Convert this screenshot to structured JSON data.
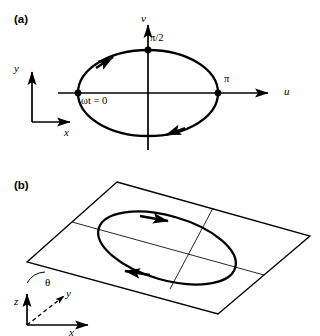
{
  "figure": {
    "type": "diagram",
    "panels": [
      {
        "id": "a",
        "label": "(a)",
        "axes": {
          "horizontal_label": "u",
          "vertical_label": "v",
          "origin_px": [
            148,
            93
          ]
        },
        "reference_axes": {
          "vertical_label": "y",
          "horizontal_label": "x",
          "corner_px": [
            32,
            122
          ]
        },
        "ellipse": {
          "center_px": [
            148,
            93
          ],
          "semi_major_px": 70,
          "semi_minor_px": 43,
          "sense": "counterclockwise"
        },
        "markers": [
          {
            "name": "phase-zero",
            "label": "ωt = 0",
            "at_px": [
              78,
              93
            ]
          },
          {
            "name": "phase-half-pi",
            "label": "π/2",
            "at_px": [
              148,
              50
            ]
          },
          {
            "name": "phase-pi",
            "label": "π",
            "at_px": [
              218,
              93
            ]
          }
        ],
        "direction_arrows": [
          {
            "name": "arrow-upper-left",
            "direction": "counterclockwise"
          },
          {
            "name": "arrow-lower-right",
            "direction": "counterclockwise"
          }
        ]
      },
      {
        "id": "b",
        "label": "(b)",
        "plane": {
          "name": "tilted-plane",
          "vertices_px": [
            [
              117,
              182
            ],
            [
              310,
              236
            ],
            [
              218,
              314
            ],
            [
              27,
              262
            ]
          ],
          "grid_lines": 2
        },
        "ellipse": {
          "center_px": [
            167,
            248
          ],
          "sense": "counterclockwise",
          "rotated": true
        },
        "angle": {
          "name": "theta",
          "label": "θ",
          "at_px": [
            47,
            283
          ]
        },
        "axes": {
          "vertical_label": "z",
          "depth_label": "y",
          "horizontal_label": "x",
          "origin_px": [
            27,
            325
          ],
          "depth_style": "dashed"
        },
        "direction_arrows": [
          {
            "name": "arrow-top-edge",
            "direction": "counterclockwise"
          },
          {
            "name": "arrow-bottom-edge",
            "direction": "counterclockwise"
          }
        ]
      }
    ]
  },
  "labels": {
    "panel_a": "(a)",
    "panel_b": "(b)",
    "u": "u",
    "v": "v",
    "x_a": "x",
    "y_a": "y",
    "omega_t_zero": "ωt = 0",
    "half_pi": "π/2",
    "pi": "π",
    "theta": "θ",
    "z_b": "z",
    "y_b": "y",
    "x_b": "x"
  }
}
